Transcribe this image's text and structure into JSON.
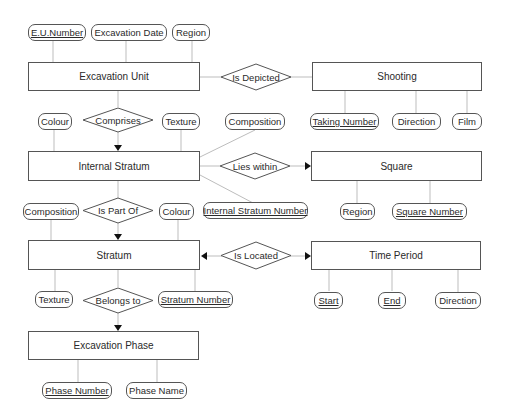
{
  "diagram": {
    "type": "entity-relationship",
    "entities": {
      "excavation_unit": "Excavation Unit",
      "shooting": "Shooting",
      "internal_stratum": "Internal Stratum",
      "square": "Square",
      "stratum": "Stratum",
      "time_period": "Time Period",
      "excavation_phase": "Excavation Phase"
    },
    "relationships": {
      "is_depicted": "Is Depicted",
      "comprises": "Comprises",
      "lies_within": "Lies within",
      "is_part_of": "Is Part Of",
      "is_located": "Is Located",
      "belongs_to": "Belongs to"
    },
    "attributes": {
      "eu_number": "E.U.Number",
      "excavation_date": "Excavation Date",
      "eu_region": "Region",
      "taking_number": "Taking Number",
      "shooting_direction": "Direction",
      "film": "Film",
      "is_colour": "Colour",
      "is_texture": "Texture",
      "is_composition": "Composition",
      "internal_stratum_number": "Internal Stratum Number",
      "square_region": "Region",
      "square_number": "Square Number",
      "stratum_composition": "Composition",
      "stratum_colour": "Colour",
      "stratum_texture": "Texture",
      "stratum_number": "Stratum Number",
      "start": "Start",
      "end": "End",
      "tp_direction": "Direction",
      "phase_number": "Phase Number",
      "phase_name": "Phase Name"
    },
    "key_attributes": [
      "E.U.Number",
      "Taking Number",
      "Internal Stratum Number",
      "Square Number",
      "Stratum Number",
      "Start",
      "End"
    ],
    "colors": {
      "line": "#555555",
      "connector": "#bbbbbb",
      "text": "#2a2a2a",
      "background": "#ffffff"
    }
  }
}
